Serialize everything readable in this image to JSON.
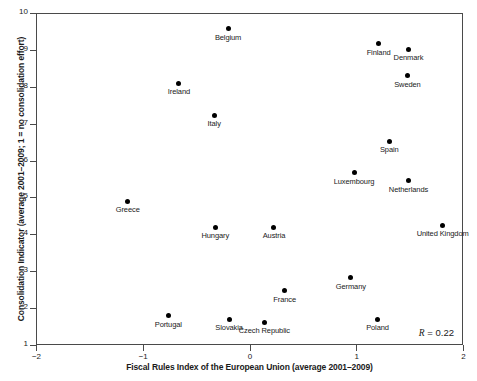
{
  "chart_data": {
    "type": "scatter",
    "title": "",
    "xlabel": "Fiscal Rules Index of the European Union (average 2001–2009)",
    "ylabel": "Consolidation Indicator (average 2001–2009; 1 = no consolidation effort)",
    "xlim": [
      -2,
      2
    ],
    "ylim": [
      1,
      10
    ],
    "xticks": [
      -2,
      -1,
      0,
      1,
      2
    ],
    "xtick_labels": [
      "−2",
      "−1",
      "0",
      "1",
      "2"
    ],
    "yticks": [
      1,
      2,
      3,
      4,
      5,
      6,
      7,
      8,
      9,
      10
    ],
    "ytick_labels": [
      "1",
      "2",
      "3",
      "4",
      "5",
      "6",
      "7",
      "8",
      "9",
      "10"
    ],
    "grid": false,
    "legend": null,
    "annotations": [
      {
        "text": "R = 0.22",
        "symbol": "R",
        "operator": " = ",
        "value": "0.22",
        "position": "bottom-right"
      }
    ],
    "points": [
      {
        "label": "Belgium",
        "x": -0.21,
        "y": 9.6
      },
      {
        "label": "Finland",
        "x": 1.2,
        "y": 9.2
      },
      {
        "label": "Denmark",
        "x": 1.48,
        "y": 9.05
      },
      {
        "label": "Sweden",
        "x": 1.47,
        "y": 8.32
      },
      {
        "label": "Ireland",
        "x": -0.67,
        "y": 8.12
      },
      {
        "label": "Italy",
        "x": -0.34,
        "y": 7.25
      },
      {
        "label": "Spain",
        "x": 1.3,
        "y": 6.55
      },
      {
        "label": "Luxembourg",
        "x": 0.97,
        "y": 5.7
      },
      {
        "label": "Netherlands",
        "x": 1.48,
        "y": 5.48
      },
      {
        "label": "Greece",
        "x": -1.15,
        "y": 4.93
      },
      {
        "label": "Hungary",
        "x": -0.33,
        "y": 4.22
      },
      {
        "label": "Austria",
        "x": 0.22,
        "y": 4.22
      },
      {
        "label": "United Kingdom",
        "x": 1.8,
        "y": 4.28
      },
      {
        "label": "Germany",
        "x": 0.94,
        "y": 2.85
      },
      {
        "label": "France",
        "x": 0.32,
        "y": 2.5
      },
      {
        "label": "Portugal",
        "x": -0.77,
        "y": 1.82
      },
      {
        "label": "Slovakia",
        "x": -0.2,
        "y": 1.72
      },
      {
        "label": "Czech Republic",
        "x": 0.13,
        "y": 1.65
      },
      {
        "label": "Poland",
        "x": 1.19,
        "y": 1.72
      }
    ]
  },
  "colors": {
    "marker": "#000000",
    "axis": "#4a4a4a",
    "text": "#1a1a1a",
    "background": "#ffffff"
  }
}
